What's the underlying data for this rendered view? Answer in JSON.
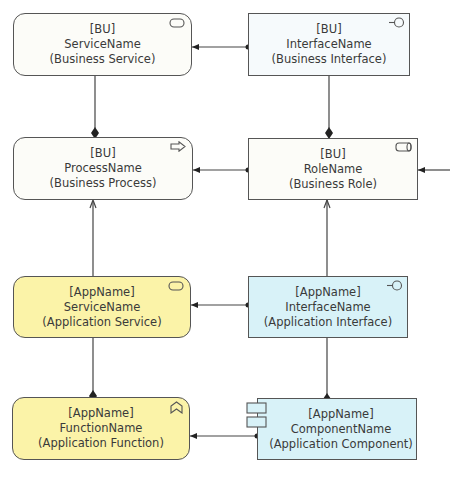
{
  "colors": {
    "business_fill": "#fcfcf8",
    "business_interface_fill": "#f6fafc",
    "app_service_fill": "#fbf3a8",
    "app_interface_fill": "#d8f2f8",
    "border": "#555555",
    "line": "#444444"
  },
  "nodes": {
    "bu_service": {
      "prefix": "[BU]",
      "name": "ServiceName",
      "type": "(Business Service)",
      "icon": "service-icon"
    },
    "bu_interface": {
      "prefix": "[BU]",
      "name": "InterfaceName",
      "type": "(Business Interface)",
      "icon": "interface-icon"
    },
    "bu_process": {
      "prefix": "[BU]",
      "name": "ProcessName",
      "type": "(Business Process)",
      "icon": "process-arrow-icon"
    },
    "bu_role": {
      "prefix": "[BU]",
      "name": "RoleName",
      "type": "(Business Role)",
      "icon": "role-icon"
    },
    "app_service": {
      "prefix": "[AppName]",
      "name": "ServiceName",
      "type": "(Application Service)",
      "icon": "service-icon"
    },
    "app_interface": {
      "prefix": "[AppName]",
      "name": "InterfaceName",
      "type": "(Application Interface)",
      "icon": "interface-icon"
    },
    "app_function": {
      "prefix": "[AppName]",
      "name": "FunctionName",
      "type": "(Application Function)",
      "icon": "function-icon"
    },
    "app_component": {
      "prefix": "[AppName]",
      "name": "ComponentName",
      "type": "(Application Component)",
      "icon": "component-icon"
    }
  },
  "relations": [
    {
      "from": "bu_interface",
      "to": "bu_service",
      "type": "assignment"
    },
    {
      "from": "bu_service",
      "to": "bu_process",
      "type": "composition"
    },
    {
      "from": "bu_interface",
      "to": "bu_role",
      "type": "composition"
    },
    {
      "from": "bu_role",
      "to": "bu_process",
      "type": "assignment"
    },
    {
      "from": "external",
      "to": "bu_role",
      "type": "assignment"
    },
    {
      "from": "app_service",
      "to": "bu_process",
      "type": "used-by"
    },
    {
      "from": "app_interface",
      "to": "bu_role",
      "type": "used-by"
    },
    {
      "from": "app_interface",
      "to": "app_service",
      "type": "assignment"
    },
    {
      "from": "app_service",
      "to": "app_function",
      "type": "composition"
    },
    {
      "from": "app_interface",
      "to": "app_component",
      "type": "composition"
    },
    {
      "from": "app_component",
      "to": "app_function",
      "type": "assignment"
    }
  ]
}
